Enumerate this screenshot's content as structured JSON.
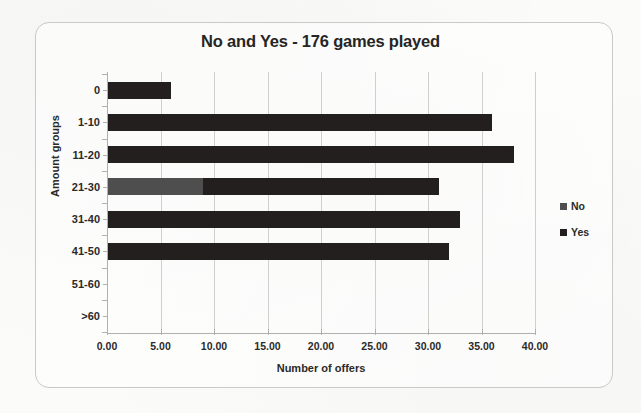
{
  "chart_data": {
    "type": "bar",
    "orientation": "horizontal",
    "stacked": true,
    "title": "No and Yes - 176 games played",
    "xlabel": "Number of offers",
    "ylabel": "Amount groups",
    "categories": [
      "0",
      "1-10",
      "11-20",
      "21-30",
      "31-40",
      "41-50",
      "51-60",
      ">60"
    ],
    "series": [
      {
        "name": "No",
        "color": "#4e4e4e",
        "values": [
          0,
          0,
          0,
          9,
          0,
          0,
          0,
          0
        ]
      },
      {
        "name": "Yes",
        "color": "#241f1f",
        "values": [
          6,
          36,
          38,
          22,
          33,
          32,
          0,
          0
        ]
      }
    ],
    "totals": [
      6,
      36,
      38,
      31,
      33,
      32,
      0,
      0
    ],
    "xlim": [
      0,
      40
    ],
    "xticks": [
      0,
      5,
      10,
      15,
      20,
      25,
      30,
      35,
      40
    ],
    "xtick_labels": [
      "0.00",
      "5.00",
      "10.00",
      "15.00",
      "20.00",
      "25.00",
      "30.00",
      "35.00",
      "40.00"
    ],
    "grid": "vertical",
    "legend_position": "right",
    "legend_entries": [
      "No",
      "Yes"
    ]
  },
  "legend": {
    "items": [
      {
        "label": "No",
        "color": "#4e4e4e"
      },
      {
        "label": "Yes",
        "color": "#241f1f"
      }
    ]
  }
}
